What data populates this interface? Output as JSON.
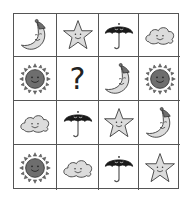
{
  "puzzle": {
    "rows": 4,
    "cols": 4,
    "missing_symbol": "?",
    "cells": [
      [
        "moon",
        "star",
        "umbrella",
        "cloud"
      ],
      [
        "sun",
        "?",
        "moon",
        "sun"
      ],
      [
        "cloud",
        "umbrella",
        "star",
        "moon"
      ],
      [
        "sun",
        "cloud",
        "umbrella",
        "star"
      ]
    ]
  },
  "colors": {
    "grid_line": "#555555",
    "light_fill": "#dcdcdc",
    "dark_fill": "#6e6e6e",
    "umbrella_fill": "#1a1a1a",
    "outline": "#333333"
  }
}
